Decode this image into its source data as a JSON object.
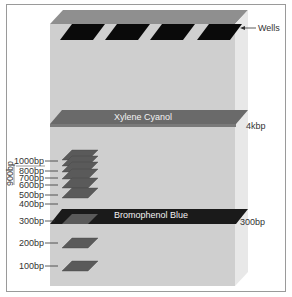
{
  "diagram": {
    "colors": {
      "gel_front": "#cfcfcf",
      "gel_top": "#8f8f8f",
      "gel_side": "#e6e6e6",
      "wells": "#0a0a0a",
      "xylene_band": "#6a6a6a",
      "bromophenol_band": "#1a1a1a",
      "ladder_band": "#5a5a5a"
    },
    "labels": {
      "wells": "Wells",
      "xylene_cyanol": "Xylene Cyanol",
      "xylene_size": "4kbp",
      "bromophenol_blue": "Bromophenol Blue",
      "bromophenol_size": "300bp",
      "bracket_900": "900bp"
    },
    "ladder": [
      {
        "label": "1000bp"
      },
      {
        "label": "800bp"
      },
      {
        "label": "700bp"
      },
      {
        "label": "600bp"
      },
      {
        "label": "500bp"
      },
      {
        "label": "400bp"
      },
      {
        "label": "300bp"
      },
      {
        "label": "200bp"
      },
      {
        "label": "100bp"
      }
    ],
    "well_count": 4
  }
}
